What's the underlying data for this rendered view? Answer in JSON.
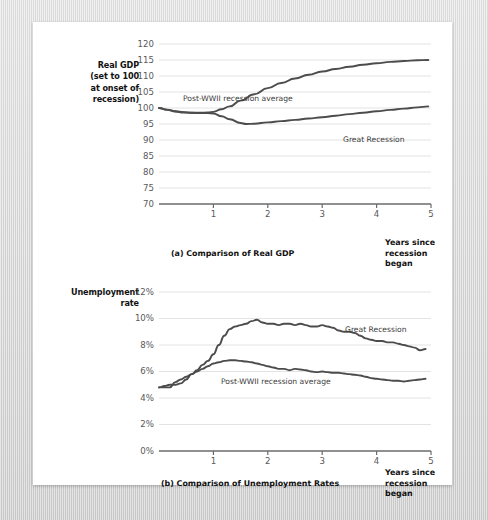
{
  "page": {
    "background_color": "#ffffff",
    "mat_color": "#d6d6d6"
  },
  "figures": [
    {
      "id": "gdp",
      "caption": "(a) Comparison of Real GDP",
      "y_axis_title": "Real GDP\n(set to 100\nat onset of\nrecession)",
      "y_axis_title_lines": [
        "Real GDP",
        "(set to 100",
        "at onset of",
        "recession)"
      ],
      "x_axis_title_lines": [
        "Years since",
        "recession began"
      ],
      "series_labels": [
        {
          "name": "post-wwii-average",
          "text": "Post-WWII recession average"
        },
        {
          "name": "great-recession",
          "text": "Great Recession"
        }
      ]
    },
    {
      "id": "unemployment",
      "caption": "(b) Comparison of Unemployment Rates",
      "y_axis_title_lines": [
        "Unemployment",
        "rate"
      ],
      "x_axis_title_lines": [
        "Years since",
        "recession began"
      ],
      "series_labels": [
        {
          "name": "great-recession",
          "text": "Great Recession"
        },
        {
          "name": "post-wwii-average",
          "text": "Post-WWII recession average"
        }
      ]
    }
  ],
  "chart_data": [
    {
      "type": "line",
      "id": "gdp",
      "title": "(a) Comparison of Real GDP",
      "xlabel": "Years since recession began",
      "ylabel": "Real GDP (set to 100 at onset of recession)",
      "xlim": [
        0,
        5
      ],
      "ylim": [
        70,
        120
      ],
      "yticks": [
        70,
        75,
        80,
        85,
        90,
        95,
        100,
        105,
        110,
        115,
        120
      ],
      "ytick_labels": [
        "70",
        "75",
        "80",
        "85",
        "90",
        "95",
        "100",
        "105",
        "110",
        "115",
        "120"
      ],
      "xticks": [
        1,
        2,
        3,
        4,
        5
      ],
      "xtick_labels": [
        "1",
        "2",
        "3",
        "4",
        "5"
      ],
      "grid": "horizontal",
      "legend": "inline-annotations",
      "line_color": "#4c4c4c",
      "series": [
        {
          "name": "Post-WWII recession average",
          "x": [
            0.0,
            0.15,
            0.3,
            0.45,
            0.6,
            0.75,
            0.9,
            1.0,
            1.15,
            1.3,
            1.5,
            1.75,
            2.0,
            2.25,
            2.5,
            2.75,
            3.0,
            3.25,
            3.5,
            3.75,
            4.0,
            4.25,
            4.5,
            4.75,
            4.95
          ],
          "values": [
            100.0,
            99.4,
            98.9,
            98.6,
            98.5,
            98.5,
            98.6,
            98.8,
            99.6,
            100.5,
            102.3,
            104.3,
            106.2,
            107.8,
            109.2,
            110.4,
            111.4,
            112.2,
            112.9,
            113.5,
            114.0,
            114.4,
            114.7,
            114.9,
            115.0
          ]
        },
        {
          "name": "Great Recession",
          "x": [
            0.0,
            0.15,
            0.3,
            0.45,
            0.6,
            0.75,
            0.9,
            1.0,
            1.15,
            1.3,
            1.5,
            1.6,
            1.75,
            2.0,
            2.25,
            2.5,
            2.75,
            3.0,
            3.25,
            3.5,
            3.75,
            4.0,
            4.25,
            4.5,
            4.75,
            4.95
          ],
          "values": [
            100.0,
            99.5,
            99.0,
            98.7,
            98.5,
            98.4,
            98.4,
            98.3,
            97.4,
            96.5,
            95.3,
            95.0,
            95.1,
            95.5,
            95.9,
            96.3,
            96.7,
            97.1,
            97.6,
            98.1,
            98.5,
            99.0,
            99.4,
            99.8,
            100.2,
            100.5
          ]
        }
      ],
      "annotations": [
        {
          "text": "Post-WWII recession average",
          "x": 1.0,
          "y": 107.5
        },
        {
          "text": "Great Recession",
          "x": 3.55,
          "y": 97.0
        }
      ]
    },
    {
      "type": "line",
      "id": "unemployment",
      "title": "(b) Comparison of Unemployment Rates",
      "xlabel": "Years since recession began",
      "ylabel": "Unemployment rate",
      "xlim": [
        0,
        5
      ],
      "ylim": [
        0,
        12
      ],
      "yticks": [
        0,
        2,
        4,
        6,
        8,
        10,
        12
      ],
      "ytick_labels": [
        "0%",
        "2%",
        "4%",
        "6%",
        "8%",
        "10%",
        "12%"
      ],
      "xticks": [
        1,
        2,
        3,
        4,
        5
      ],
      "xtick_labels": [
        "1",
        "2",
        "3",
        "4",
        "5"
      ],
      "grid": "horizontal",
      "legend": "inline-annotations",
      "line_color": "#4c4c4c",
      "series": [
        {
          "name": "Great Recession",
          "x": [
            0.0,
            0.1,
            0.2,
            0.3,
            0.4,
            0.5,
            0.6,
            0.7,
            0.8,
            0.9,
            1.0,
            1.1,
            1.2,
            1.3,
            1.4,
            1.5,
            1.6,
            1.7,
            1.8,
            1.9,
            2.0,
            2.1,
            2.2,
            2.3,
            2.4,
            2.5,
            2.6,
            2.7,
            2.8,
            2.9,
            3.0,
            3.1,
            3.2,
            3.3,
            3.4,
            3.5,
            3.6,
            3.7,
            3.8,
            3.9,
            4.0,
            4.1,
            4.2,
            4.3,
            4.4,
            4.5,
            4.6,
            4.7,
            4.8,
            4.9
          ],
          "values": [
            4.8,
            4.9,
            5.0,
            5.0,
            5.1,
            5.4,
            5.8,
            6.1,
            6.5,
            6.8,
            7.3,
            8.0,
            8.7,
            9.2,
            9.4,
            9.5,
            9.6,
            9.8,
            9.9,
            9.7,
            9.6,
            9.6,
            9.5,
            9.6,
            9.6,
            9.5,
            9.6,
            9.5,
            9.4,
            9.4,
            9.5,
            9.4,
            9.3,
            9.1,
            9.0,
            9.0,
            8.9,
            8.7,
            8.5,
            8.4,
            8.3,
            8.3,
            8.2,
            8.2,
            8.1,
            8.0,
            7.9,
            7.8,
            7.6,
            7.7
          ]
        },
        {
          "name": "Post-WWII recession average",
          "x": [
            0.0,
            0.1,
            0.2,
            0.3,
            0.4,
            0.5,
            0.6,
            0.7,
            0.8,
            0.9,
            1.0,
            1.1,
            1.2,
            1.3,
            1.4,
            1.5,
            1.6,
            1.7,
            1.8,
            1.9,
            2.0,
            2.1,
            2.2,
            2.3,
            2.4,
            2.5,
            2.6,
            2.7,
            2.8,
            2.9,
            3.0,
            3.1,
            3.2,
            3.3,
            3.4,
            3.5,
            3.6,
            3.7,
            3.8,
            3.9,
            4.0,
            4.1,
            4.2,
            4.3,
            4.4,
            4.5,
            4.6,
            4.7,
            4.8,
            4.9
          ],
          "values": [
            4.8,
            4.8,
            4.8,
            5.2,
            5.4,
            5.6,
            5.8,
            6.0,
            6.2,
            6.4,
            6.6,
            6.7,
            6.8,
            6.85,
            6.85,
            6.8,
            6.75,
            6.7,
            6.6,
            6.5,
            6.4,
            6.3,
            6.2,
            6.2,
            6.1,
            6.2,
            6.15,
            6.1,
            6.0,
            5.95,
            6.0,
            5.95,
            5.9,
            5.9,
            5.85,
            5.8,
            5.75,
            5.7,
            5.6,
            5.5,
            5.45,
            5.4,
            5.35,
            5.3,
            5.3,
            5.25,
            5.3,
            5.35,
            5.4,
            5.45
          ]
        }
      ],
      "annotations": [
        {
          "text": "Great Recession",
          "x": 3.3,
          "y": 9.9
        },
        {
          "text": "Post-WWII recession average",
          "x": 1.75,
          "y": 5.25
        }
      ]
    }
  ]
}
